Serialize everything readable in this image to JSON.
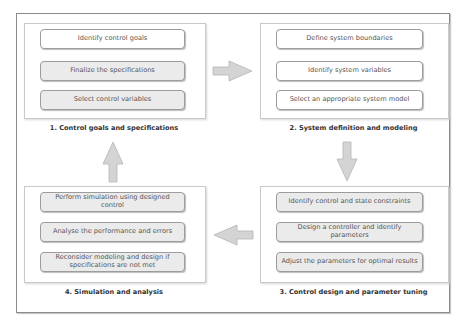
{
  "diagram": {
    "groups": [
      {
        "label": "1. Control goals and specifications",
        "items": [
          {
            "text": "Identify control goals",
            "fill": "white"
          },
          {
            "text": "Finalize the specifications",
            "fill": "gray"
          },
          {
            "text": "Select control variables",
            "fill": "gray"
          }
        ]
      },
      {
        "label": "2. System definition and modeling",
        "items": [
          {
            "text": "Define system boundaries",
            "fill": "white"
          },
          {
            "text": "Identify system variables",
            "fill": "white"
          },
          {
            "text": "Select an appropriate system model",
            "fill": "white"
          }
        ]
      },
      {
        "label": "3. Control design and parameter tuning",
        "items": [
          {
            "text": "Identify control and state constraints",
            "fill": "gray"
          },
          {
            "text": "Design a controller and identify parameters",
            "fill": "gray"
          },
          {
            "text": "Adjust the parameters for optimal results",
            "fill": "gray"
          }
        ]
      },
      {
        "label": "4. Simulation and analysis",
        "items": [
          {
            "text": "Perform simulation using designed control",
            "fill": "gray"
          },
          {
            "text": "Analyse the performance and errors",
            "fill": "gray"
          },
          {
            "text": "Reconsider modeling and design if specifications are not met",
            "fill": "gray"
          }
        ]
      }
    ],
    "flow": [
      {
        "from": 1,
        "to": 2,
        "direction": "right"
      },
      {
        "from": 2,
        "to": 3,
        "direction": "down"
      },
      {
        "from": 3,
        "to": 4,
        "direction": "left"
      },
      {
        "from": 4,
        "to": 1,
        "direction": "up"
      }
    ],
    "colors": {
      "frame_border": "#8a8a8a",
      "panel_border": "#c9c9c9",
      "item_border": "#9c9c9c",
      "item_gray_fill": "#ebebeb",
      "arrow_fill": "#d4d4d4",
      "arrow_stroke": "#b5b5b5"
    }
  }
}
